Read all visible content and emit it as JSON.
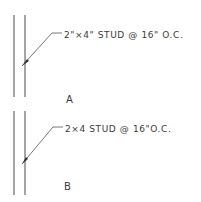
{
  "diagram": {
    "details": [
      {
        "id": "A",
        "label": "A",
        "note": "2\"×4\" STUD @ 16\" O.C."
      },
      {
        "id": "B",
        "label": "B",
        "note": "2×4 STUD @ 16\"O.C."
      }
    ],
    "colors": {
      "line": "#4a4a4a",
      "text": "#3a3a3a",
      "background": "#ffffff"
    }
  }
}
